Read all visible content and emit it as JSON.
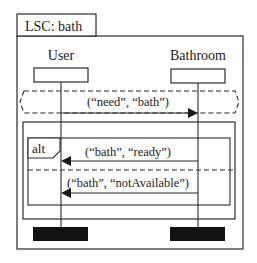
{
  "chart": {
    "title": "LSC: bath",
    "lifelines": [
      {
        "name": "User"
      },
      {
        "name": "Bathroom"
      }
    ],
    "prechart": {
      "messages": [
        {
          "label": "(“need”, “bath”)",
          "from": "User",
          "to": "Bathroom"
        }
      ]
    },
    "alt": {
      "label": "alt",
      "operands": [
        {
          "messages": [
            {
              "label": "(“bath”, “ready”)",
              "from": "Bathroom",
              "to": "User"
            }
          ]
        },
        {
          "messages": [
            {
              "label": "(“bath”, “notAvailable”)",
              "from": "Bathroom",
              "to": "User"
            }
          ]
        }
      ]
    }
  },
  "colors": {
    "line": "#2a2a2a",
    "end_box": "#111111",
    "background": "#ffffff"
  }
}
